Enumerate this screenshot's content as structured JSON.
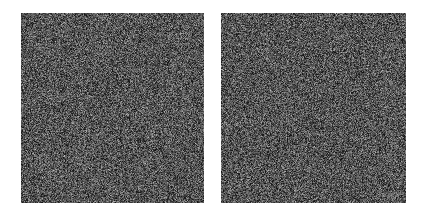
{
  "figure": {
    "background_color": "#ffffff",
    "width": 426,
    "height": 217,
    "title": "",
    "caption": ""
  },
  "layout": {
    "panel_count": 2,
    "gap_x": 204,
    "gap_width": 17,
    "gap_color": "#ffffff"
  },
  "panels": [
    {
      "id": "left-noise-panel",
      "label": "",
      "x": 21,
      "y": 13,
      "width": 183,
      "height": 190,
      "content_type": "random-noise",
      "grain_size": 1,
      "mean_gray": "#555555",
      "min_gray": "#141414",
      "max_gray": "#c8c8c8",
      "seed": 11
    },
    {
      "id": "right-noise-panel",
      "label": "",
      "x": 221,
      "y": 13,
      "width": 185,
      "height": 190,
      "content_type": "random-noise",
      "grain_size": 1,
      "mean_gray": "#555555",
      "min_gray": "#141414",
      "max_gray": "#c8c8c8",
      "seed": 97
    }
  ]
}
